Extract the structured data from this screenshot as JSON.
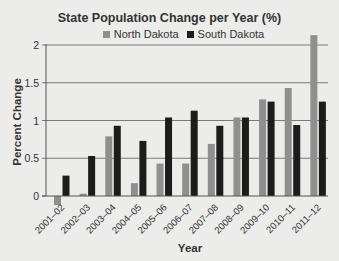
{
  "chart_data": {
    "type": "bar",
    "title": "State Population Change per Year (%)",
    "xlabel": "Year",
    "ylabel": "Percent Change",
    "ylim": [
      -0.15,
      2.2
    ],
    "yticks": [
      0,
      0.5,
      1,
      1.5,
      2
    ],
    "ytick_labels": [
      "0",
      "0.5",
      "1",
      "1.5",
      "2"
    ],
    "grid": true,
    "legend_position": "top",
    "categories": [
      "2001–02",
      "2002–03",
      "2003–04",
      "2004–05",
      "2005–06",
      "2006–07",
      "2007–08",
      "2008–09",
      "2009–10",
      "2010–11",
      "2011–12"
    ],
    "series": [
      {
        "name": "North Dakota",
        "color": "#8f8f8f",
        "values": [
          -0.12,
          0.03,
          0.79,
          0.17,
          0.43,
          0.43,
          0.69,
          1.04,
          1.28,
          1.43,
          2.13
        ]
      },
      {
        "name": "South Dakota",
        "color": "#1c1c1c",
        "values": [
          0.27,
          0.53,
          0.93,
          0.73,
          1.04,
          1.13,
          0.93,
          1.04,
          1.25,
          0.94,
          1.25
        ]
      }
    ]
  },
  "legend": {
    "items": [
      {
        "label": "North Dakota",
        "color": "#8f8f8f"
      },
      {
        "label": "South Dakota",
        "color": "#1c1c1c"
      }
    ]
  },
  "colors": {
    "background": "#ececea",
    "gridline": "#7a7a7a",
    "text": "#333333"
  }
}
